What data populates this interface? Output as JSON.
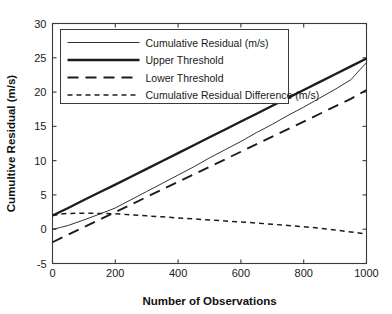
{
  "chart_data": {
    "type": "line",
    "title": "",
    "xlabel": "Number of Observations",
    "ylabel": "Cumultive Residual (m/s)",
    "xlim": [
      0,
      1000
    ],
    "ylim": [
      -5,
      30
    ],
    "xticks": [
      0,
      200,
      400,
      600,
      800,
      1000
    ],
    "yticks": [
      -5,
      0,
      5,
      10,
      15,
      20,
      25,
      30
    ],
    "xtick_labels": [
      "0",
      "200",
      "400",
      "600",
      "800",
      "1000"
    ],
    "ytick_labels": [
      "-5",
      "0",
      "5",
      "10",
      "15",
      "20",
      "25",
      "30"
    ],
    "grid": false,
    "legend_position": "upper left",
    "x": [
      0,
      25,
      50,
      75,
      100,
      150,
      200,
      250,
      300,
      350,
      400,
      450,
      500,
      550,
      600,
      650,
      700,
      750,
      800,
      850,
      900,
      950,
      1000
    ],
    "series": [
      {
        "name": "Cumulative Residual (m/s)",
        "style": "thin-solid",
        "values": [
          0.0,
          0.25,
          0.55,
          0.95,
          1.35,
          2.2,
          3.1,
          4.3,
          5.5,
          6.7,
          7.9,
          9.1,
          10.4,
          11.6,
          12.8,
          14.1,
          15.3,
          16.6,
          17.8,
          19.1,
          20.4,
          21.8,
          24.3
        ]
      },
      {
        "name": "Upper Threshold",
        "style": "thick-solid",
        "values": [
          2.0,
          2.55,
          3.1,
          3.68,
          4.25,
          5.4,
          6.5,
          7.65,
          8.8,
          9.95,
          11.1,
          12.25,
          13.4,
          14.55,
          15.7,
          16.85,
          18.0,
          19.15,
          20.3,
          21.45,
          22.6,
          23.75,
          24.9
        ]
      },
      {
        "name": "Lower Threshold",
        "style": "long-dash",
        "values": [
          -1.9,
          -1.35,
          -0.8,
          -0.25,
          0.3,
          1.4,
          2.5,
          3.6,
          4.7,
          5.8,
          6.9,
          8.0,
          9.1,
          10.2,
          11.3,
          12.4,
          13.5,
          14.6,
          15.7,
          16.8,
          17.9,
          19.0,
          20.3
        ]
      },
      {
        "name": "Cumulative Residual Difference (m/s)",
        "style": "short-dash",
        "values": [
          2.0,
          2.2,
          2.3,
          2.32,
          2.33,
          2.3,
          2.25,
          2.1,
          1.95,
          1.8,
          1.65,
          1.5,
          1.35,
          1.2,
          1.05,
          0.9,
          0.72,
          0.55,
          0.35,
          0.15,
          -0.1,
          -0.4,
          -0.7
        ]
      }
    ]
  }
}
